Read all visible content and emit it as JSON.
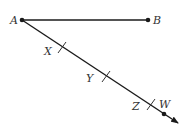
{
  "diagram": {
    "type": "geometry-ray-construction",
    "points": [
      {
        "label": "A",
        "x": 22,
        "y": 20,
        "label_x": 10,
        "label_y": 24
      },
      {
        "label": "B",
        "x": 148,
        "y": 20,
        "label_x": 153,
        "label_y": 24
      },
      {
        "label": "W",
        "x": 164,
        "y": 114,
        "label_x": 159,
        "label_y": 108
      }
    ],
    "ticks": [
      {
        "label": "X",
        "x": 62,
        "y": 48,
        "label_x": 44,
        "label_y": 55
      },
      {
        "label": "Y",
        "x": 106,
        "y": 76,
        "label_x": 86,
        "label_y": 82
      },
      {
        "label": "Z",
        "x": 151,
        "y": 104,
        "label_x": 132,
        "label_y": 110
      }
    ],
    "segment_AB": {
      "from": "A",
      "to": "B"
    },
    "ray_AW": {
      "from": "A",
      "through": "W",
      "arrow_end_x": 178,
      "arrow_end_y": 123
    },
    "line_color": "#1a1a1a",
    "label_color": "#333333"
  }
}
